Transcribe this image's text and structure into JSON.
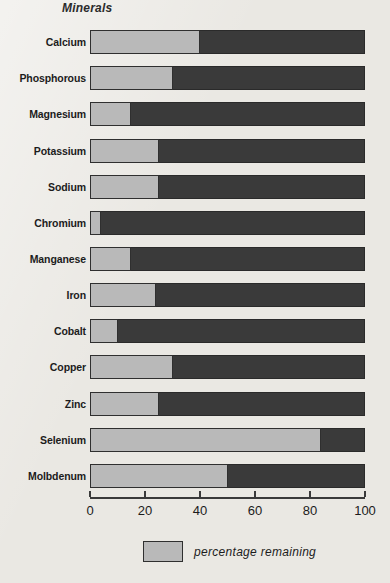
{
  "chart_data": {
    "type": "bar",
    "orientation": "horizontal",
    "stacked": true,
    "title": "",
    "xlabel": "",
    "ylabel": "Minerals",
    "xlim": [
      0,
      100
    ],
    "xticks": [
      0,
      20,
      40,
      60,
      80,
      100
    ],
    "grid": false,
    "legend_position": "bottom",
    "categories": [
      "Calcium",
      "Phosphorous",
      "Magnesium",
      "Potassium",
      "Sodium",
      "Chromium",
      "Manganese",
      "Iron",
      "Cobalt",
      "Copper",
      "Zinc",
      "Selenium",
      "Molbdenum"
    ],
    "series": [
      {
        "name": "percentage remaining",
        "color": "#b9b9b9",
        "values": [
          40,
          30,
          15,
          25,
          25,
          4,
          15,
          24,
          10,
          30,
          25,
          84,
          50
        ]
      },
      {
        "name": "percentage lost",
        "color": "#3a3a3a",
        "values": [
          60,
          70,
          85,
          75,
          75,
          96,
          85,
          76,
          90,
          70,
          75,
          16,
          50
        ]
      }
    ]
  },
  "axis": {
    "y_title": "Minerals",
    "tick_labels": [
      "0",
      "20",
      "40",
      "60",
      "80",
      "100"
    ]
  },
  "legend": {
    "label": "percentage remaining"
  },
  "colors": {
    "remaining": "#b9b9b9",
    "lost": "#3a3a3a",
    "background": "#eae8e3",
    "text": "#1c1c1c"
  }
}
